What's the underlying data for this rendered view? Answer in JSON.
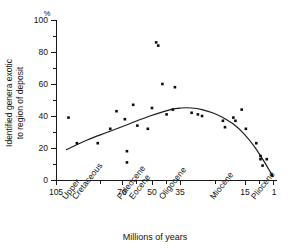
{
  "chart_data": {
    "type": "scatter",
    "title": "",
    "xlabel": "Millions of years",
    "ylabel": "Identified genera exotic to region of deposit",
    "ylabel_line1": "Identified genera exotic",
    "ylabel_line2": "to region of deposit",
    "yunit": "%",
    "grid": false,
    "legend": "none",
    "xlim": [
      105,
      1
    ],
    "ylim": [
      0,
      100
    ],
    "x_axis_inverted": true,
    "x_tick_labels": [
      "105",
      "70",
      "50",
      "35",
      "15",
      "1"
    ],
    "x_tick_values": [
      105,
      70,
      50,
      35,
      15,
      1
    ],
    "x_tick_px": [
      56,
      122,
      152,
      180,
      245,
      273
    ],
    "x_minor_tick_px": [
      100,
      136,
      166,
      215,
      259
    ],
    "y_tick_labels": [
      "0",
      "20",
      "40",
      "60",
      "80",
      "100"
    ],
    "y_tick_values": [
      0,
      20,
      40,
      60,
      80,
      100
    ],
    "y_minor_tick_values": [
      10,
      30,
      50,
      70,
      90
    ],
    "epoch_labels": [
      {
        "label": "Upper",
        "px": 72,
        "row": 0
      },
      {
        "label": "Cretaceous",
        "px": 82,
        "row": 1
      },
      {
        "label": "Paleocene",
        "px": 126,
        "row": 0
      },
      {
        "label": "Eocene",
        "px": 138,
        "row": 1
      },
      {
        "label": "Oligocene",
        "px": 166,
        "row": 0
      },
      {
        "label": "Miocene",
        "px": 218,
        "row": 0
      },
      {
        "label": "Pliocene",
        "px": 258,
        "row": 0
      }
    ],
    "points": [
      {
        "x": 99,
        "y": 39
      },
      {
        "x": 95,
        "y": 23
      },
      {
        "x": 85,
        "y": 23
      },
      {
        "x": 79,
        "y": 32
      },
      {
        "x": 76,
        "y": 43
      },
      {
        "x": 72,
        "y": 38
      },
      {
        "x": 71,
        "y": 18
      },
      {
        "x": 71,
        "y": 11
      },
      {
        "x": 68,
        "y": 47
      },
      {
        "x": 66,
        "y": 34
      },
      {
        "x": 61,
        "y": 32
      },
      {
        "x": 59,
        "y": 45
      },
      {
        "x": 57,
        "y": 86
      },
      {
        "x": 56,
        "y": 84
      },
      {
        "x": 54,
        "y": 60
      },
      {
        "x": 52,
        "y": 41
      },
      {
        "x": 49,
        "y": 44
      },
      {
        "x": 48,
        "y": 58
      },
      {
        "x": 40,
        "y": 42
      },
      {
        "x": 37,
        "y": 41
      },
      {
        "x": 35,
        "y": 40
      },
      {
        "x": 25,
        "y": 37
      },
      {
        "x": 24,
        "y": 33
      },
      {
        "x": 20,
        "y": 39
      },
      {
        "x": 19,
        "y": 37
      },
      {
        "x": 16,
        "y": 44
      },
      {
        "x": 14,
        "y": 32
      },
      {
        "x": 9,
        "y": 23
      },
      {
        "x": 7,
        "y": 15
      },
      {
        "x": 7,
        "y": 13
      },
      {
        "x": 6,
        "y": 9
      },
      {
        "x": 4,
        "y": 13
      },
      {
        "x": 1.5,
        "y": 3
      }
    ],
    "fit_curve_description": "Smooth quadratic trend rising from about 19% at 100 Ma to a peak of about 45% near 45 Ma, then falling steeply to about 2% at 1 Ma.",
    "fit_curve_points": [
      {
        "x": 100,
        "y": 19
      },
      {
        "x": 90,
        "y": 25
      },
      {
        "x": 80,
        "y": 30
      },
      {
        "x": 70,
        "y": 35
      },
      {
        "x": 60,
        "y": 40
      },
      {
        "x": 50,
        "y": 44
      },
      {
        "x": 45,
        "y": 45
      },
      {
        "x": 40,
        "y": 45
      },
      {
        "x": 35,
        "y": 44
      },
      {
        "x": 30,
        "y": 42
      },
      {
        "x": 25,
        "y": 39
      },
      {
        "x": 20,
        "y": 35
      },
      {
        "x": 15,
        "y": 29
      },
      {
        "x": 10,
        "y": 21
      },
      {
        "x": 5,
        "y": 11
      },
      {
        "x": 1,
        "y": 2
      }
    ]
  }
}
